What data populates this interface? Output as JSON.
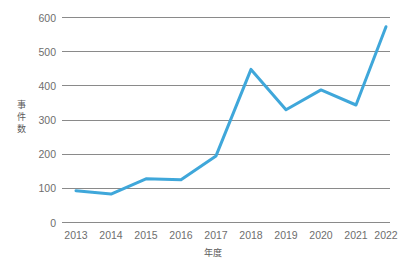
{
  "chart_data": {
    "type": "line",
    "title": "",
    "xlabel": "年度",
    "ylabel": "事件数",
    "categories": [
      "2013",
      "2014",
      "2015",
      "2016",
      "2017",
      "2018",
      "2019",
      "2020",
      "2021",
      "2022"
    ],
    "values": [
      93,
      83,
      128,
      125,
      195,
      448,
      330,
      388,
      344,
      573
    ],
    "series": [
      {
        "name": "事件数",
        "values": [
          93,
          83,
          128,
          125,
          195,
          448,
          330,
          388,
          344,
          573
        ]
      }
    ],
    "ylim": [
      0,
      600
    ],
    "yticks": [
      0,
      100,
      200,
      300,
      400,
      500,
      600
    ],
    "ytick_labels": [
      "0",
      "100",
      "200",
      "300",
      "400",
      "500",
      "600"
    ],
    "grid": true,
    "grid_axis": "y",
    "legend": false,
    "legend_position": "none",
    "line_color": "#3fa7da",
    "grid_color": "#8a8a8a",
    "text_color": "#6e6e6e",
    "background_color": "#ffffff",
    "markers": false
  },
  "ylabel_chars": [
    "事",
    "件",
    "数"
  ]
}
